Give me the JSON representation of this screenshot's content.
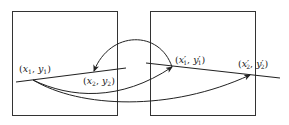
{
  "diagram": {
    "type": "point-correspondence",
    "frames": [
      {
        "id": "frame-1",
        "label": ""
      },
      {
        "id": "frame-2",
        "label": ""
      }
    ],
    "points": [
      {
        "id": "p1",
        "var_x": "x",
        "var_y": "y",
        "sub": "1",
        "prime": "",
        "text": "(x1, y1)"
      },
      {
        "id": "p2",
        "var_x": "x",
        "var_y": "y",
        "sub": "2",
        "prime": "",
        "text": "(x2, y2)"
      },
      {
        "id": "p1p",
        "var_x": "x",
        "var_y": "y",
        "sub": "1",
        "prime": "′",
        "text": "(x′1, y′1)"
      },
      {
        "id": "p2p",
        "var_x": "x",
        "var_y": "y",
        "sub": "2",
        "prime": "′",
        "text": "(x′2, y′2)"
      }
    ],
    "arrows": [
      {
        "from": "(x1, y1)",
        "to": "(x′1, y′1)"
      },
      {
        "from": "(x1, y1)",
        "to": "(x′2, y′2)"
      },
      {
        "from": "(x′1, y′1)",
        "to": "(x2, y2)"
      }
    ],
    "colors": {
      "stroke": "#222222",
      "background": "#ffffff"
    }
  }
}
